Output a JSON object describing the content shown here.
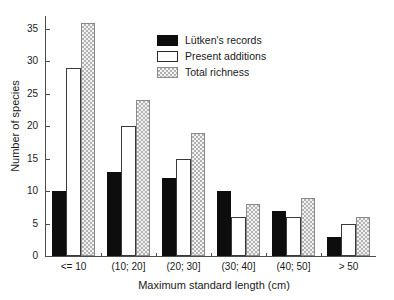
{
  "chart_data": {
    "type": "bar",
    "title": "",
    "xlabel": "Maximum standard length (cm)",
    "ylabel": "Number of species",
    "categories": [
      "<= 10",
      "(10; 20]",
      "(20; 30]",
      "(30; 40]",
      "(40; 50]",
      "> 50"
    ],
    "series": [
      {
        "name": "Lütken's records",
        "values": [
          10,
          13,
          12,
          10,
          7,
          3
        ],
        "color": "#0d0d0d",
        "style": "solid-black"
      },
      {
        "name": "Present additions",
        "values": [
          29,
          20,
          15,
          6,
          6,
          5
        ],
        "color": "#ffffff",
        "style": "white-outline"
      },
      {
        "name": "Total richness",
        "values": [
          36,
          24,
          19,
          8,
          9,
          6
        ],
        "color": "#c0c0c0",
        "style": "gray-checkered"
      }
    ],
    "ylim": [
      0,
      37
    ],
    "yticks": [
      0,
      5,
      10,
      15,
      20,
      25,
      30,
      35
    ],
    "ytick_labels": [
      "0",
      "5",
      "10",
      "15",
      "20",
      "25",
      "30",
      "35"
    ],
    "grid": false,
    "legend_position": "top-center",
    "legend_entries": [
      "Lütken's records",
      "Present additions",
      "Total richness"
    ]
  },
  "axes": {
    "x_title": "Maximum standard length (cm)",
    "y_title": "Number of species"
  }
}
